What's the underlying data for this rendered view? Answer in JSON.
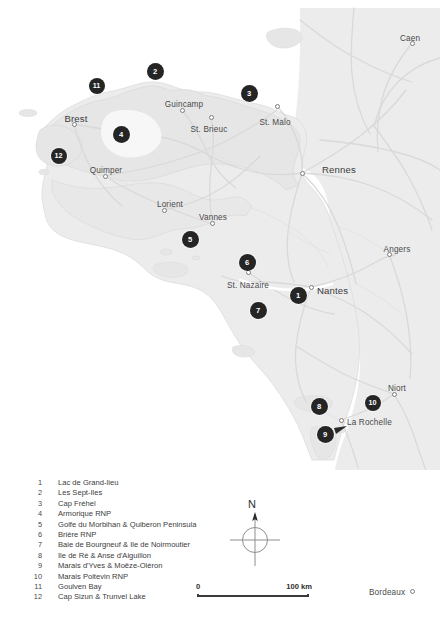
{
  "figure": {
    "kind": "reference-map",
    "region": "Brittany and French Atlantic coast",
    "background_color": "#ffffff",
    "land_color": "#e9e9e9",
    "road_color": "#d6d6d6",
    "marker_color": "#252525",
    "label_color": "#3c3c3c"
  },
  "cities": [
    {
      "name": "Caen",
      "x": 410,
      "y": 34,
      "size": "small",
      "dot_x": 412,
      "dot_y": 43,
      "align": "center"
    },
    {
      "name": "Brest",
      "x": 76,
      "y": 113,
      "size": "big",
      "dot_x": 74,
      "dot_y": 124,
      "align": "center"
    },
    {
      "name": "Guincamp",
      "x": 184,
      "y": 100,
      "size": "small",
      "dot_x": 182,
      "dot_y": 110,
      "align": "center"
    },
    {
      "name": "St. Brieuc",
      "x": 209,
      "y": 125,
      "size": "small",
      "dot_x": 211,
      "dot_y": 117,
      "align": "center"
    },
    {
      "name": "St. Malo",
      "x": 275,
      "y": 118,
      "size": "small",
      "dot_x": 277,
      "dot_y": 106,
      "align": "center"
    },
    {
      "name": "Rennes",
      "x": 322,
      "y": 164,
      "size": "big",
      "dot_x": 302,
      "dot_y": 173,
      "align": "left"
    },
    {
      "name": "Quimper",
      "x": 106,
      "y": 166,
      "size": "small",
      "dot_x": 105,
      "dot_y": 176,
      "align": "center"
    },
    {
      "name": "Lorient",
      "x": 170,
      "y": 200,
      "size": "small",
      "dot_x": 164,
      "dot_y": 210,
      "align": "center"
    },
    {
      "name": "Vannes",
      "x": 213,
      "y": 213,
      "size": "small",
      "dot_x": 212,
      "dot_y": 223,
      "align": "center"
    },
    {
      "name": "Angers",
      "x": 397,
      "y": 245,
      "size": "small",
      "dot_x": 389,
      "dot_y": 254,
      "align": "center"
    },
    {
      "name": "St. Nazaire",
      "x": 248,
      "y": 281,
      "size": "small",
      "dot_x": 248,
      "dot_y": 272,
      "align": "center"
    },
    {
      "name": "Nantes",
      "x": 317,
      "y": 285,
      "size": "big",
      "dot_x": 311,
      "dot_y": 287,
      "align": "left"
    },
    {
      "name": "Niort",
      "x": 397,
      "y": 384,
      "size": "small",
      "dot_x": 394,
      "dot_y": 394,
      "align": "center"
    },
    {
      "name": "La Rochelle",
      "x": 347,
      "y": 418,
      "size": "small",
      "dot_x": 341,
      "dot_y": 420,
      "align": "left"
    },
    {
      "name": "Bordeaux",
      "x": 369,
      "y": 588,
      "size": "small",
      "dot_x": 412,
      "dot_y": 591,
      "align": "left"
    }
  ],
  "site_markers": [
    {
      "number": "1",
      "x": 298,
      "y": 295
    },
    {
      "number": "2",
      "x": 155,
      "y": 71
    },
    {
      "number": "3",
      "x": 249,
      "y": 93
    },
    {
      "number": "4",
      "x": 121,
      "y": 134
    },
    {
      "number": "5",
      "x": 190,
      "y": 239
    },
    {
      "number": "6",
      "x": 247,
      "y": 262
    },
    {
      "number": "7",
      "x": 258,
      "y": 310
    },
    {
      "number": "8",
      "x": 319,
      "y": 406
    },
    {
      "number": "9",
      "x": 325,
      "y": 434
    },
    {
      "number": "10",
      "x": 373,
      "y": 403
    },
    {
      "number": "11",
      "x": 97,
      "y": 86
    },
    {
      "number": "12",
      "x": 59,
      "y": 156
    }
  ],
  "legend": {
    "entries": [
      {
        "number": "1",
        "label": "Lac de Grand-lieu"
      },
      {
        "number": "2",
        "label": "Les Sept-Iles"
      },
      {
        "number": "3",
        "label": "Cap Fréhel"
      },
      {
        "number": "4",
        "label": "Armorique RNP"
      },
      {
        "number": "5",
        "label": "Golfe du Morbihan & Quiberon Peninsula"
      },
      {
        "number": "6",
        "label": "Brière RNP"
      },
      {
        "number": "7",
        "label": "Baie de Bourgneuf & Ile de Noirmoutier"
      },
      {
        "number": "8",
        "label": "Ile de Ré & Anse d'Aiguillon"
      },
      {
        "number": "9",
        "label": "Marais d'Yves & Moëze-Oléron"
      },
      {
        "number": "10",
        "label": "Marais Poitevin RNP"
      },
      {
        "number": "11",
        "label": "Goulven Bay"
      },
      {
        "number": "12",
        "label": "Cap Sizun & Trunvel Lake"
      }
    ]
  },
  "compass": {
    "north_label": "N"
  },
  "scale_bar": {
    "min_label": "0",
    "max_label": "100 km",
    "length_km": 100
  }
}
